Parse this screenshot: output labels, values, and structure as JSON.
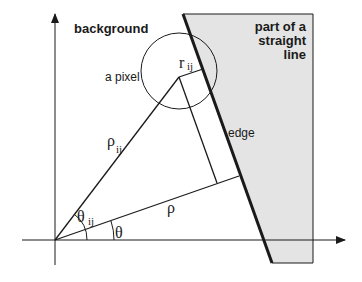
{
  "diagram": {
    "labels": {
      "background": "background",
      "region_line1": "part of a",
      "region_line2": "straight",
      "region_line3": "line",
      "pixel": "a pixel",
      "edge": "edge",
      "r": "r",
      "r_sub": "ij",
      "rho_ij": "ρ",
      "rho_ij_sub": "ij",
      "rho": "ρ",
      "theta_ij": "θ",
      "theta_ij_sub": "ij",
      "theta": "θ"
    },
    "colors": {
      "region_fill": "#e4e4e4",
      "stroke": "#1a1a1a"
    }
  }
}
